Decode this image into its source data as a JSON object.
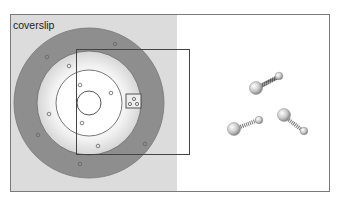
{
  "figure": {
    "coverslip_label": "coverslip",
    "colors": {
      "background": "#ffffff",
      "coverslip_panel": "#dcdcdc",
      "outer_ring": "#8c8c8c",
      "middle_ring": "#d8d8d8",
      "inner_disk": "#f4f4f4",
      "outline": "#555555",
      "dumbbell_ball": "#c8c8c8",
      "dumbbell_spring": "#666666"
    }
  }
}
